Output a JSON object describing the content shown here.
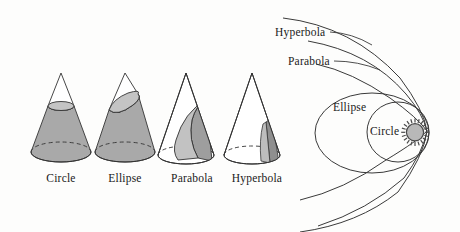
{
  "figure": {
    "background_color": "#fdfdfc",
    "stroke_color": "#333333",
    "fill_gray": "#a9a9a9",
    "fill_light_gray": "#c4c4c4",
    "fill_white": "#ffffff"
  },
  "cones": [
    {
      "name": "circle-cone",
      "label": "Circle",
      "label_x": 61,
      "label_y": 178,
      "apex_x": 61,
      "apex_y": 73,
      "base_cx": 61,
      "base_cy": 152,
      "base_rx": 30,
      "base_ry": 10,
      "cut_type": "horizontal",
      "cut_cx": 61,
      "cut_cy": 106,
      "cut_rx": 13,
      "cut_ry": 4.5,
      "body_fill": "#a9a9a9",
      "cut_fill": "#c4c4c4"
    },
    {
      "name": "ellipse-cone",
      "label": "Ellipse",
      "label_x": 125,
      "label_y": 178,
      "apex_x": 125,
      "apex_y": 73,
      "base_cx": 125,
      "base_cy": 152,
      "base_rx": 30,
      "base_ry": 10,
      "cut_type": "oblique",
      "body_fill": "#a9a9a9",
      "cut_fill": "#c4c4c4"
    },
    {
      "name": "parabola-cone",
      "label": "Parabola",
      "label_x": 192,
      "label_y": 178,
      "apex_x": 186,
      "apex_y": 73,
      "base_cx": 186,
      "base_cy": 155,
      "base_rx": 28,
      "base_ry": 9,
      "cut_type": "parabolic",
      "body_fill": "#ffffff",
      "cut_fill": "#b6b6b6"
    },
    {
      "name": "hyperbola-cone",
      "label": "Hyperbola",
      "label_x": 257,
      "label_y": 178,
      "apex_x": 252,
      "apex_y": 73,
      "base_cx": 252,
      "base_cy": 155,
      "base_rx": 28,
      "base_ry": 9,
      "cut_type": "vertical",
      "body_fill": "#ffffff",
      "cut_fill": "#a2a2a2"
    }
  ],
  "orbit_diagram": {
    "focus_x": 428,
    "focus_y": 132,
    "sun": {
      "name": "sun",
      "cx": 415,
      "cy": 132,
      "r": 8.5,
      "fill": "#b8b8b8",
      "ray_count": 20
    },
    "labels": [
      {
        "name": "orbit-label-hyperbola",
        "text": "Hyperbola",
        "x": 275,
        "y": 28
      },
      {
        "name": "orbit-label-parabola",
        "text": "Parabola",
        "x": 288,
        "y": 57
      },
      {
        "name": "orbit-label-ellipse",
        "text": "Ellipse",
        "x": 333,
        "y": 103
      },
      {
        "name": "orbit-label-circle",
        "text": "Circle",
        "x": 370,
        "y": 127
      }
    ],
    "leader_lines": [
      {
        "name": "leader-hyperbola",
        "x1": 330,
        "y1": 33,
        "x2": 372,
        "y2": 44
      },
      {
        "name": "leader-parabola",
        "x1": 335,
        "y1": 62,
        "x2": 378,
        "y2": 70
      }
    ],
    "curves": [
      {
        "name": "circle-orbit",
        "type": "ellipse",
        "cx": 398,
        "cy": 132,
        "rx": 31,
        "ry": 30
      },
      {
        "name": "ellipse-orbit",
        "type": "ellipse",
        "cx": 372,
        "cy": 133,
        "rx": 57,
        "ry": 40
      },
      {
        "name": "parabola-orbit",
        "type": "open"
      },
      {
        "name": "hyperbola-orbit",
        "type": "open"
      },
      {
        "name": "hyperbola-orbit-2",
        "type": "open"
      }
    ]
  }
}
